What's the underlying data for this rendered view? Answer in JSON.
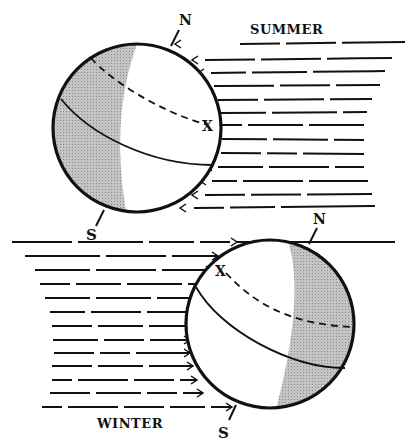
{
  "figure": {
    "summer": {
      "label": "SUMMER",
      "north_label": "N",
      "south_label": "S",
      "marker": "X",
      "sun_direction": "from-right"
    },
    "winter": {
      "label": "WINTER",
      "north_label": "N",
      "south_label": "S",
      "marker": "X",
      "sun_direction": "from-left"
    },
    "colors": {
      "ink": "#111111",
      "shade": "#b8b8b8",
      "background": "#ffffff"
    }
  }
}
